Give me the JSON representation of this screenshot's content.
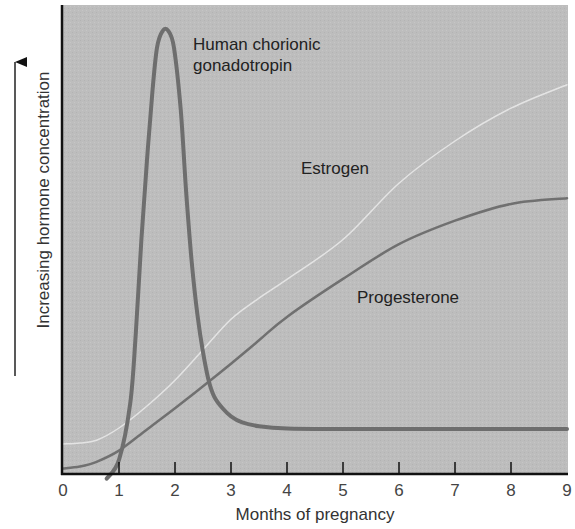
{
  "chart_data": {
    "type": "line",
    "title": "",
    "xlabel": "Months of pregnancy",
    "ylabel": "Increasing hormone concentration",
    "x_ticks": [
      "0",
      "1",
      "2",
      "3",
      "4",
      "5",
      "6",
      "7",
      "8",
      "9"
    ],
    "xlim": [
      0,
      9
    ],
    "ylim": [
      0,
      100
    ],
    "y_units": "relative (arbitrary, no numeric ticks)",
    "grid": false,
    "legend": "inline labels",
    "series": [
      {
        "name": "Human chorionic gonadotropin",
        "label_lines": [
          "Human chorionic",
          "gonadotropin"
        ],
        "color": "#6e6e6e",
        "stroke_width": 4,
        "points": [
          [
            0.78,
            -1
          ],
          [
            1.0,
            3
          ],
          [
            1.2,
            15
          ],
          [
            1.3,
            30
          ],
          [
            1.4,
            50
          ],
          [
            1.5,
            67
          ],
          [
            1.6,
            82
          ],
          [
            1.68,
            91
          ],
          [
            1.78,
            94.5
          ],
          [
            1.88,
            94.5
          ],
          [
            1.98,
            91
          ],
          [
            2.1,
            78
          ],
          [
            2.2,
            60
          ],
          [
            2.3,
            45
          ],
          [
            2.4,
            34
          ],
          [
            2.5,
            26
          ],
          [
            2.6,
            20
          ],
          [
            2.7,
            16.5
          ],
          [
            2.85,
            14
          ],
          [
            3.0,
            12.3
          ],
          [
            3.2,
            11
          ],
          [
            3.5,
            10.2
          ],
          [
            4.0,
            9.7
          ],
          [
            5,
            9.6
          ],
          [
            6,
            9.6
          ],
          [
            7,
            9.6
          ],
          [
            8,
            9.6
          ],
          [
            9,
            9.6
          ]
        ]
      },
      {
        "name": "Estrogen",
        "label_lines": [
          "Estrogen"
        ],
        "color": "#e4e4e4",
        "stroke_width": 1.5,
        "points": [
          [
            0,
            6.4
          ],
          [
            0.3,
            6.6
          ],
          [
            0.6,
            7.2
          ],
          [
            1,
            9.8
          ],
          [
            1.5,
            14.5
          ],
          [
            2,
            20
          ],
          [
            2.5,
            26.5
          ],
          [
            3,
            33
          ],
          [
            3.5,
            37.5
          ],
          [
            4,
            41.5
          ],
          [
            5,
            50
          ],
          [
            6,
            62
          ],
          [
            7,
            71
          ],
          [
            8,
            78
          ],
          [
            9,
            83
          ]
        ]
      },
      {
        "name": "Progesterone",
        "label_lines": [
          "Progesterone"
        ],
        "color": "#707070",
        "stroke_width": 2.5,
        "points": [
          [
            0,
            1.2
          ],
          [
            0.3,
            1.6
          ],
          [
            0.6,
            2.6
          ],
          [
            1,
            5
          ],
          [
            1.5,
            9.5
          ],
          [
            2,
            14
          ],
          [
            2.5,
            18.7
          ],
          [
            3,
            23.5
          ],
          [
            3.5,
            28.5
          ],
          [
            4,
            33.5
          ],
          [
            5,
            41.6
          ],
          [
            6,
            49
          ],
          [
            7,
            54
          ],
          [
            8,
            57.6
          ],
          [
            9,
            58.8
          ]
        ]
      }
    ]
  },
  "labels": {
    "hcg_line1": "Human chorionic",
    "hcg_line2": "gonadotropin",
    "estrogen": "Estrogen",
    "progesterone": "Progesterone",
    "xlabel": "Months of pregnancy",
    "ylabel": "Increasing hormone concentration"
  },
  "colors": {
    "plot_background": "#bdbdbd",
    "axis": "#111111"
  }
}
